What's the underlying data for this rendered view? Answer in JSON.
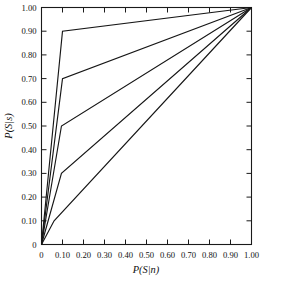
{
  "chart_data": {
    "type": "line",
    "title": "",
    "xlabel": "P(S|n)",
    "ylabel": "P(S|s)",
    "xlim": [
      0,
      1
    ],
    "ylim": [
      0,
      1
    ],
    "grid": false,
    "legend": "none",
    "xticks": [
      0,
      0.1,
      0.2,
      0.3,
      0.4,
      0.5,
      0.6,
      0.7,
      0.8,
      0.9,
      1.0
    ],
    "xticklabels": [
      "0",
      "0.10",
      "0.20",
      "0.30",
      "0.40",
      "0.50",
      "0.60",
      "0.70",
      "0.80",
      "0.90",
      "1.00"
    ],
    "yticks": [
      0,
      0.1,
      0.2,
      0.3,
      0.4,
      0.5,
      0.6,
      0.7,
      0.8,
      0.9,
      1.0
    ],
    "yticklabels": [
      "0",
      "0.10",
      "0.20",
      "0.30",
      "0.40",
      "0.50",
      "0.60",
      "0.70",
      "0.80",
      "0.90",
      "1.00"
    ],
    "series": [
      {
        "name": "curve-1",
        "x": [
          0.0,
          0.1,
          1.0
        ],
        "y": [
          0.0,
          0.9,
          1.0
        ]
      },
      {
        "name": "curve-2",
        "x": [
          0.0,
          0.1,
          1.0
        ],
        "y": [
          0.0,
          0.7,
          1.0
        ]
      },
      {
        "name": "curve-3",
        "x": [
          0.0,
          0.095,
          1.0
        ],
        "y": [
          0.0,
          0.5,
          1.0
        ]
      },
      {
        "name": "curve-4",
        "x": [
          0.0,
          0.095,
          1.0
        ],
        "y": [
          0.0,
          0.3,
          1.0
        ]
      },
      {
        "name": "curve-5",
        "x": [
          0.0,
          0.06,
          1.0
        ],
        "y": [
          0.0,
          0.1,
          1.0
        ]
      }
    ]
  },
  "axes": {
    "x_title": "P(S|n)",
    "y_title": "P(S|s)"
  }
}
